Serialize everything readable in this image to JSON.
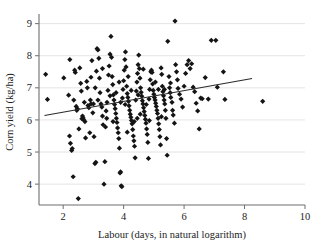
{
  "chart_data": {
    "type": "scatter",
    "title": "",
    "xlabel": "Labour (days, in natural logarithm)",
    "ylabel": "Corn yield (kg/ha)",
    "xlim": [
      1.2,
      10.0
    ],
    "ylim": [
      3.35,
      9.3
    ],
    "xticks": [
      2,
      4,
      6,
      8,
      10
    ],
    "yticks": [
      4,
      5,
      6,
      7,
      8,
      9
    ],
    "xtick_labels": [
      "2",
      "4",
      "6",
      "8",
      "10"
    ],
    "ytick_labels": [
      "4",
      "5",
      "6",
      "7",
      "8",
      "9"
    ],
    "grid": "horizontal",
    "grid_color": "#d8d8d8",
    "axis_color": "#6e6e6e",
    "marker_color": "#141414",
    "marker_shape": "diamond",
    "marker_size": 2.6,
    "legend": null,
    "fit_line": {
      "name": "linear fit",
      "color": "#2b2b2b",
      "x": [
        1.38,
        8.25
      ],
      "y": [
        6.14,
        7.29
      ],
      "slope": 0.167,
      "intercept": 5.91
    },
    "points": [
      [
        1.42,
        7.42
      ],
      [
        1.48,
        6.64
      ],
      [
        2.02,
        7.31
      ],
      [
        2.22,
        7.88
      ],
      [
        2.18,
        6.77
      ],
      [
        2.21,
        5.5
      ],
      [
        2.24,
        5.27
      ],
      [
        2.28,
        5.05
      ],
      [
        2.3,
        5.11
      ],
      [
        2.33,
        4.23
      ],
      [
        2.38,
        7.55
      ],
      [
        2.4,
        7.48
      ],
      [
        2.43,
        6.42
      ],
      [
        2.45,
        6.3
      ],
      [
        2.47,
        6.35
      ],
      [
        2.5,
        3.55
      ],
      [
        2.52,
        5.72
      ],
      [
        2.55,
        7.62
      ],
      [
        2.58,
        7.14
      ],
      [
        2.6,
        6.9
      ],
      [
        2.62,
        6.04
      ],
      [
        2.64,
        6.12
      ],
      [
        2.66,
        6.06
      ],
      [
        2.7,
        6.55
      ],
      [
        2.72,
        5.95
      ],
      [
        2.74,
        5.44
      ],
      [
        2.78,
        7.2
      ],
      [
        2.8,
        7.0
      ],
      [
        2.82,
        6.45
      ],
      [
        2.85,
        6.38
      ],
      [
        2.88,
        5.6
      ],
      [
        2.9,
        6.62
      ],
      [
        2.92,
        7.33
      ],
      [
        2.95,
        7.85
      ],
      [
        2.98,
        6.22
      ],
      [
        3.0,
        6.5
      ],
      [
        3.02,
        5.48
      ],
      [
        3.05,
        4.64
      ],
      [
        3.08,
        4.68
      ],
      [
        3.1,
        7.52
      ],
      [
        3.12,
        8.22
      ],
      [
        3.15,
        8.18
      ],
      [
        3.18,
        7.92
      ],
      [
        3.2,
        7.3
      ],
      [
        3.22,
        6.85
      ],
      [
        3.25,
        6.5
      ],
      [
        3.28,
        6.4
      ],
      [
        3.3,
        6.12
      ],
      [
        3.32,
        5.85
      ],
      [
        3.35,
        4.0
      ],
      [
        3.38,
        4.7
      ],
      [
        3.4,
        5.78
      ],
      [
        3.42,
        6.28
      ],
      [
        3.45,
        6.55
      ],
      [
        3.48,
        6.92
      ],
      [
        3.5,
        7.4
      ],
      [
        3.52,
        7.68
      ],
      [
        3.55,
        8.05
      ],
      [
        3.58,
        8.6
      ],
      [
        3.6,
        7.95
      ],
      [
        3.62,
        7.35
      ],
      [
        3.64,
        7.1
      ],
      [
        3.66,
        6.78
      ],
      [
        3.68,
        6.62
      ],
      [
        3.7,
        6.48
      ],
      [
        3.72,
        6.35
      ],
      [
        3.74,
        6.2
      ],
      [
        3.76,
        6.05
      ],
      [
        3.78,
        5.92
      ],
      [
        3.8,
        5.75
      ],
      [
        3.82,
        5.6
      ],
      [
        3.84,
        5.42
      ],
      [
        3.86,
        5.12
      ],
      [
        3.88,
        4.35
      ],
      [
        3.9,
        4.38
      ],
      [
        3.92,
        3.95
      ],
      [
        3.94,
        3.92
      ],
      [
        3.96,
        6.68
      ],
      [
        3.98,
        6.95
      ],
      [
        4.0,
        7.22
      ],
      [
        4.02,
        7.55
      ],
      [
        4.04,
        7.88
      ],
      [
        4.06,
        8.12
      ],
      [
        4.08,
        7.65
      ],
      [
        4.1,
        7.05
      ],
      [
        4.12,
        6.82
      ],
      [
        4.14,
        6.7
      ],
      [
        4.16,
        6.58
      ],
      [
        4.18,
        6.44
      ],
      [
        4.2,
        6.3
      ],
      [
        4.22,
        6.18
      ],
      [
        4.24,
        6.08
      ],
      [
        4.26,
        5.98
      ],
      [
        4.28,
        5.88
      ],
      [
        4.3,
        5.7
      ],
      [
        4.32,
        5.5
      ],
      [
        4.34,
        5.35
      ],
      [
        4.36,
        5.18
      ],
      [
        4.38,
        4.82
      ],
      [
        4.4,
        6.62
      ],
      [
        4.42,
        6.9
      ],
      [
        4.44,
        7.18
      ],
      [
        4.46,
        7.45
      ],
      [
        4.48,
        7.72
      ],
      [
        4.5,
        8.02
      ],
      [
        4.52,
        7.6
      ],
      [
        4.54,
        7.3
      ],
      [
        4.56,
        7.0
      ],
      [
        4.58,
        6.86
      ],
      [
        4.6,
        6.74
      ],
      [
        4.62,
        6.6
      ],
      [
        4.64,
        6.5
      ],
      [
        4.66,
        6.38
      ],
      [
        4.68,
        6.26
      ],
      [
        4.7,
        6.14
      ],
      [
        4.72,
        6.02
      ],
      [
        4.74,
        5.9
      ],
      [
        4.76,
        5.72
      ],
      [
        4.78,
        5.55
      ],
      [
        4.8,
        5.3
      ],
      [
        4.82,
        4.8
      ],
      [
        4.84,
        6.65
      ],
      [
        4.86,
        6.95
      ],
      [
        4.88,
        7.25
      ],
      [
        4.9,
        7.5
      ],
      [
        4.92,
        7.55
      ],
      [
        4.94,
        7.48
      ],
      [
        4.96,
        7.12
      ],
      [
        4.98,
        6.92
      ],
      [
        5.0,
        6.8
      ],
      [
        5.02,
        6.7
      ],
      [
        5.04,
        6.62
      ],
      [
        5.06,
        6.52
      ],
      [
        5.08,
        6.42
      ],
      [
        5.1,
        6.3
      ],
      [
        5.12,
        6.2
      ],
      [
        5.14,
        6.05
      ],
      [
        5.16,
        5.88
      ],
      [
        5.18,
        5.7
      ],
      [
        5.2,
        5.48
      ],
      [
        5.22,
        5.22
      ],
      [
        5.24,
        7.62
      ],
      [
        5.26,
        7.42
      ],
      [
        5.28,
        7.05
      ],
      [
        5.3,
        6.88
      ],
      [
        5.32,
        6.75
      ],
      [
        5.34,
        6.62
      ],
      [
        5.36,
        6.5
      ],
      [
        5.38,
        6.3
      ],
      [
        5.4,
        6.05
      ],
      [
        5.42,
        5.42
      ],
      [
        5.44,
        4.9
      ],
      [
        5.46,
        8.45
      ],
      [
        5.5,
        7.35
      ],
      [
        5.52,
        7.0
      ],
      [
        5.54,
        6.85
      ],
      [
        5.56,
        6.7
      ],
      [
        5.6,
        6.55
      ],
      [
        5.62,
        6.3
      ],
      [
        5.64,
        6.15
      ],
      [
        5.68,
        5.9
      ],
      [
        5.7,
        9.08
      ],
      [
        5.72,
        7.72
      ],
      [
        5.75,
        7.5
      ],
      [
        5.78,
        7.25
      ],
      [
        5.8,
        6.98
      ],
      [
        5.85,
        6.8
      ],
      [
        5.9,
        6.65
      ],
      [
        5.95,
        6.4
      ],
      [
        6.0,
        7.05
      ],
      [
        6.05,
        7.45
      ],
      [
        6.1,
        7.72
      ],
      [
        6.15,
        7.85
      ],
      [
        6.2,
        7.6
      ],
      [
        6.25,
        7.75
      ],
      [
        6.3,
        7.02
      ],
      [
        6.35,
        6.88
      ],
      [
        6.4,
        6.52
      ],
      [
        6.45,
        6.28
      ],
      [
        6.5,
        5.72
      ],
      [
        6.55,
        6.68
      ],
      [
        6.6,
        6.66
      ],
      [
        6.7,
        7.32
      ],
      [
        6.8,
        6.65
      ],
      [
        6.9,
        8.48
      ],
      [
        7.05,
        8.48
      ],
      [
        7.1,
        7.02
      ],
      [
        7.3,
        7.5
      ],
      [
        7.35,
        6.64
      ],
      [
        8.6,
        6.58
      ],
      [
        3.06,
        7.0
      ],
      [
        3.44,
        6.05
      ],
      [
        4.05,
        6.48
      ],
      [
        4.45,
        6.05
      ],
      [
        4.15,
        7.35
      ],
      [
        3.85,
        7.18
      ],
      [
        4.65,
        7.58
      ],
      [
        5.05,
        7.18
      ],
      [
        2.35,
        6.62
      ],
      [
        2.68,
        6.0
      ],
      [
        3.15,
        6.62
      ],
      [
        3.55,
        6.75
      ],
      [
        4.25,
        6.92
      ],
      [
        4.75,
        6.48
      ],
      [
        5.15,
        6.95
      ],
      [
        5.55,
        7.15
      ],
      [
        3.3,
        7.6
      ],
      [
        3.9,
        6.55
      ],
      [
        4.35,
        5.95
      ],
      [
        4.55,
        6.18
      ],
      [
        2.92,
        6.5
      ],
      [
        3.65,
        5.95
      ],
      [
        4.12,
        5.62
      ],
      [
        4.85,
        5.98
      ],
      [
        5.25,
        6.1
      ],
      [
        3.75,
        6.85
      ],
      [
        4.48,
        6.78
      ],
      [
        5.35,
        6.95
      ]
    ]
  }
}
